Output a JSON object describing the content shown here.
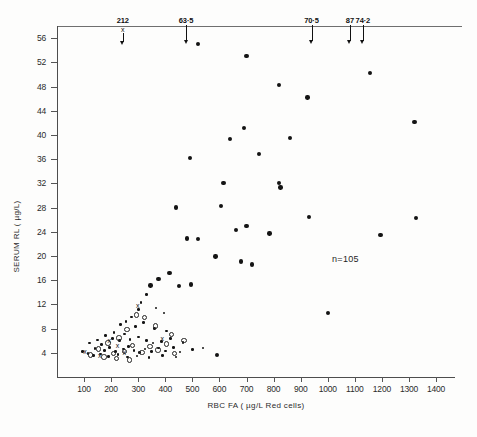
{
  "chart_data": {
    "type": "scatter",
    "title": "",
    "xlabel": "RBC  FA ( µg/L  Red cells)",
    "ylabel": "SERUM  RL ( µg/L)",
    "xlim": [
      0,
      1470
    ],
    "ylim": [
      0,
      58
    ],
    "xticks": [
      100,
      200,
      300,
      400,
      500,
      600,
      700,
      800,
      900,
      1000,
      1100,
      1200,
      1300,
      1400
    ],
    "yticks": [
      4,
      8,
      12,
      16,
      20,
      24,
      28,
      32,
      36,
      40,
      44,
      48,
      52,
      56
    ],
    "grid": false,
    "legend": "none",
    "annotations": [
      {
        "text": "n=105",
        "x": 1075,
        "y": 19.4
      }
    ],
    "offscale_arrows": [
      {
        "label": "212",
        "x": 243,
        "marker": "x"
      },
      {
        "label": "63·5",
        "x": 477,
        "marker": "arrow"
      },
      {
        "label": "70·5",
        "x": 940,
        "marker": "arrow"
      },
      {
        "label": "87",
        "x": 1082,
        "marker": "arrow"
      },
      {
        "label": "74·2",
        "x": 1130,
        "marker": "arrow"
      }
    ],
    "series": [
      {
        "name": "filled-circle",
        "marker": "filled-circle",
        "points": [
          [
            520,
            55.0
          ],
          [
            700,
            53.0
          ],
          [
            1155,
            50.2
          ],
          [
            820,
            48.2
          ],
          [
            925,
            46.2
          ],
          [
            1320,
            42.1
          ],
          [
            690,
            41.1
          ],
          [
            640,
            39.3
          ],
          [
            860,
            39.5
          ],
          [
            490,
            36.2
          ],
          [
            745,
            36.8
          ],
          [
            615,
            32.0
          ],
          [
            820,
            32.1
          ],
          [
            825,
            31.3
          ],
          [
            440,
            28.0
          ],
          [
            605,
            28.3
          ],
          [
            930,
            26.4
          ],
          [
            1325,
            26.3
          ],
          [
            700,
            25.0
          ],
          [
            1195,
            23.5
          ],
          [
            660,
            24.3
          ],
          [
            785,
            23.7
          ],
          [
            480,
            22.9
          ],
          [
            520,
            22.8
          ],
          [
            585,
            19.9
          ],
          [
            680,
            19.1
          ],
          [
            720,
            18.6
          ],
          [
            415,
            17.2
          ],
          [
            375,
            16.2
          ],
          [
            345,
            15.1
          ],
          [
            1000,
            10.6
          ],
          [
            450,
            15.0
          ],
          [
            495,
            15.3
          ],
          [
            330,
            13.6
          ],
          [
            310,
            12.3
          ],
          [
            300,
            11.2
          ],
          [
            365,
            11.4
          ],
          [
            395,
            10.6
          ],
          [
            275,
            9.9
          ],
          [
            255,
            9.2
          ],
          [
            235,
            8.7
          ],
          [
            290,
            8.3
          ],
          [
            320,
            9.0
          ],
          [
            360,
            8.0
          ],
          [
            405,
            7.6
          ],
          [
            210,
            7.4
          ],
          [
            250,
            7.1
          ],
          [
            180,
            6.9
          ],
          [
            205,
            6.4
          ],
          [
            150,
            6.1
          ],
          [
            120,
            5.6
          ],
          [
            165,
            5.4
          ],
          [
            230,
            6.0
          ],
          [
            270,
            6.2
          ],
          [
            300,
            6.6
          ],
          [
            330,
            6.0
          ],
          [
            355,
            5.6
          ],
          [
            385,
            5.9
          ],
          [
            420,
            6.4
          ],
          [
            465,
            5.7
          ],
          [
            140,
            4.7
          ],
          [
            175,
            4.4
          ],
          [
            195,
            4.9
          ],
          [
            215,
            4.2
          ],
          [
            245,
            4.6
          ],
          [
            265,
            5.0
          ],
          [
            285,
            4.4
          ],
          [
            305,
            4.0
          ],
          [
            325,
            4.6
          ],
          [
            350,
            4.2
          ],
          [
            375,
            4.8
          ],
          [
            400,
            4.3
          ],
          [
            430,
            4.9
          ],
          [
            455,
            4.1
          ],
          [
            500,
            4.5
          ],
          [
            540,
            4.8
          ],
          [
            95,
            4.2
          ],
          [
            115,
            3.9
          ],
          [
            135,
            3.6
          ],
          [
            160,
            3.8
          ],
          [
            190,
            3.4
          ],
          [
            225,
            3.7
          ],
          [
            260,
            3.3
          ],
          [
            295,
            3.5
          ],
          [
            340,
            3.2
          ],
          [
            390,
            3.6
          ],
          [
            440,
            3.3
          ],
          [
            590,
            3.6
          ]
        ]
      },
      {
        "name": "open-circle",
        "marker": "open-circle",
        "points": [
          [
            290,
            10.4
          ],
          [
            320,
            10.0
          ],
          [
            255,
            8.0
          ],
          [
            360,
            8.6
          ],
          [
            420,
            7.2
          ],
          [
            225,
            6.6
          ],
          [
            185,
            5.8
          ],
          [
            275,
            5.4
          ],
          [
            340,
            5.2
          ],
          [
            400,
            5.6
          ],
          [
            465,
            6.2
          ],
          [
            150,
            4.8
          ],
          [
            205,
            4.0
          ],
          [
            245,
            4.4
          ],
          [
            310,
            4.2
          ],
          [
            370,
            4.6
          ],
          [
            430,
            4.0
          ],
          [
            120,
            3.8
          ],
          [
            170,
            3.5
          ],
          [
            215,
            3.2
          ],
          [
            265,
            3.0
          ]
        ]
      },
      {
        "name": "cross",
        "marker": "x",
        "points": [
          [
            300,
            11.9
          ],
          [
            390,
            6.4
          ],
          [
            195,
            6.0
          ],
          [
            225,
            5.2
          ],
          [
            105,
            4.2
          ],
          [
            250,
            4.0
          ],
          [
            160,
            3.6
          ]
        ]
      }
    ]
  },
  "axis": {
    "y_title": "SERUM  RL ( µg/L)",
    "x_title": "RBC  FA ( µg/L  Red cells)"
  }
}
